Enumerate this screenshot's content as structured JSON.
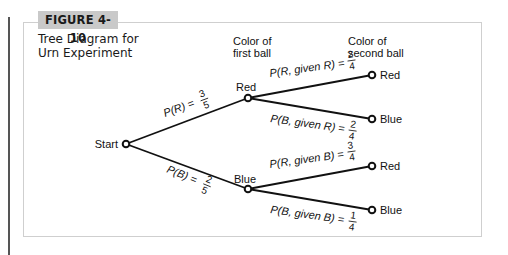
{
  "figure": {
    "badge": "FIGURE 4-10",
    "caption_line1": "Tree Diagram for",
    "caption_line2": "Urn Experiment"
  },
  "columns": {
    "first_line1": "Color of",
    "first_line2": "first ball",
    "second_line1": "Color of",
    "second_line2": "second ball"
  },
  "nodes": {
    "start": "Start",
    "first_red": "Red",
    "first_blue": "Blue",
    "rr": "Red",
    "rb": "Blue",
    "br": "Red",
    "bb": "Blue"
  },
  "edges": {
    "p_r": {
      "label": "P(R) =",
      "num": "3",
      "den": "5"
    },
    "p_b": {
      "label": "P(B) =",
      "num": "2",
      "den": "5"
    },
    "p_r_given_r": {
      "label": "P(R, given R) =",
      "num": "2",
      "den": "4"
    },
    "p_b_given_r": {
      "label": "P(B, given R) =",
      "num": "2",
      "den": "4"
    },
    "p_r_given_b": {
      "label": "P(R, given B) =",
      "num": "3",
      "den": "4"
    },
    "p_b_given_b": {
      "label": "P(B, given B) =",
      "num": "1",
      "den": "4"
    }
  },
  "colors": {
    "badge_bg": "#c9c9c9",
    "frame": "#cfcfcf",
    "side_bar": "#555555",
    "ink": "#111111"
  }
}
